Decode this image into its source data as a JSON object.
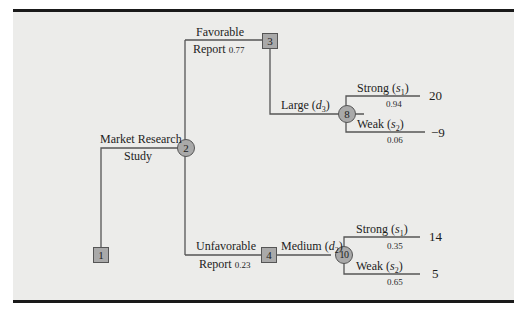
{
  "diagram": {
    "type": "decision-tree",
    "colors": {
      "background": "#ececea",
      "node_fill": "#a9a9a9",
      "line": "#555555",
      "rule": "#1a1a1a"
    },
    "nodes": [
      {
        "id": "1",
        "shape": "decision-square"
      },
      {
        "id": "2",
        "shape": "chance-circle"
      },
      {
        "id": "3",
        "shape": "decision-square"
      },
      {
        "id": "4",
        "shape": "decision-square"
      },
      {
        "id": "8",
        "shape": "chance-circle"
      },
      {
        "id": "10",
        "shape": "chance-circle"
      }
    ],
    "branches": {
      "market_research": {
        "line1": "Market Research",
        "line2": "Study"
      },
      "favorable": {
        "line1": "Favorable",
        "line2": "Report",
        "prob": "0.77"
      },
      "unfavorable": {
        "line1": "Unfavorable",
        "line2": "Report",
        "prob": "0.23"
      },
      "large": {
        "text": "Large (",
        "var": "d",
        "sub": "3",
        "close": ")"
      },
      "medium": {
        "text": "Medium (",
        "var": "d",
        "sub": "2",
        "close": ")"
      },
      "n8_strong": {
        "text": "Strong (",
        "var": "s",
        "sub": "1",
        "close": ")",
        "prob": "0.94",
        "payoff": "20"
      },
      "n8_weak": {
        "text": "Weak (",
        "var": "s",
        "sub": "2",
        "close": ")",
        "prob": "0.06",
        "payoff": "−9"
      },
      "n10_strong": {
        "text": "Strong (",
        "var": "s",
        "sub": "1",
        "close": ")",
        "prob": "0.35",
        "payoff": "14"
      },
      "n10_weak": {
        "text": "Weak (",
        "var": "s",
        "sub": "2",
        "close": ")",
        "prob": "0.65",
        "payoff": "5"
      }
    }
  }
}
